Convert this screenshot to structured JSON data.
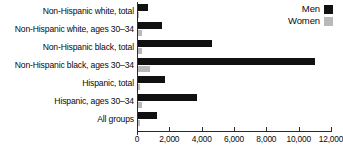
{
  "chart_data": {
    "type": "bar",
    "orientation": "horizontal",
    "title": "",
    "subtitle": "",
    "xlabel": "",
    "ylabel": "",
    "xlim": [
      0,
      12000
    ],
    "xticks": [
      0,
      2000,
      4000,
      6000,
      8000,
      10000,
      12000
    ],
    "xtick_labels": [
      "0",
      "2,000",
      "4,000",
      "6,000",
      "8,000",
      "10,000",
      "12,000"
    ],
    "grid": false,
    "legend_position": "top-right",
    "categories": [
      "Non-Hispanic white, total",
      "Non-Hispanic white, ages 30–34",
      "Non-Hispanic black, total",
      "Non-Hispanic black, ages 30–34",
      "Hispanic, total",
      "Hispanic, ages 30–34",
      "All groups"
    ],
    "series": [
      {
        "name": "Men",
        "color": "#111111",
        "values": [
          650,
          1550,
          4650,
          11000,
          1750,
          3700,
          1250
        ]
      },
      {
        "name": "Women",
        "color": "#b9b9b9",
        "values": [
          120,
          280,
          330,
          800,
          170,
          320,
          170
        ]
      }
    ]
  },
  "legend": {
    "items": [
      {
        "label": "Men",
        "color": "#111111"
      },
      {
        "label": "Women",
        "color": "#b9b9b9"
      }
    ]
  }
}
